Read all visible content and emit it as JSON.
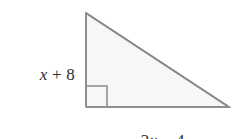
{
  "figure": {
    "kind": "right-triangle-diagram",
    "background_color": "#ffffff",
    "stroke_color": "#8a8a8a",
    "fill_color": "#f7f7f7",
    "text_color": "#2e2e2e",
    "labels": {
      "vertical_leg": {
        "full_text": "x + 8",
        "coefficient": "",
        "variable": "x",
        "operator": "+",
        "constant": "8"
      },
      "horizontal_leg": {
        "full_text": "2x − 4",
        "coefficient": "2",
        "variable": "x",
        "operator": "−",
        "constant": "4"
      }
    },
    "right_angle_marker": "right-angle-square",
    "vertices": {
      "apex": "86,13",
      "right_angle": "86,107",
      "base_right": "229,107"
    }
  }
}
